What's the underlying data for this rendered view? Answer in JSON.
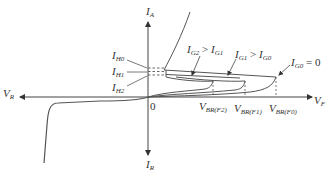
{
  "diagram": {
    "title": "",
    "type": "thyristor-iv-characteristic",
    "axes": {
      "vertical_up": {
        "symbol": "I",
        "sub": "A"
      },
      "vertical_down": {
        "symbol": "I",
        "sub": "R"
      },
      "horizontal_right": {
        "symbol": "V",
        "sub": "F"
      },
      "horizontal_left": {
        "symbol": "V",
        "sub": "R"
      },
      "origin": "0"
    },
    "holding_currents": [
      {
        "symbol": "I",
        "sub": "H0"
      },
      {
        "symbol": "I",
        "sub": "H1"
      },
      {
        "symbol": "I",
        "sub": "H2"
      }
    ],
    "breakover_voltages": [
      {
        "symbol": "V",
        "sub": "BR(F2)"
      },
      {
        "symbol": "V",
        "sub": "BR(F1)"
      },
      {
        "symbol": "V",
        "sub": "BR(F0)"
      }
    ],
    "gate_annotations": [
      {
        "a": "I",
        "a_sub": "G2",
        "op": " > ",
        "b": "I",
        "b_sub": "G1"
      },
      {
        "a": "I",
        "a_sub": "G1",
        "op": " > ",
        "b": "I",
        "b_sub": "G0"
      },
      {
        "a": "I",
        "a_sub": "G0",
        "op": " = ",
        "b": "0",
        "b_sub": ""
      }
    ],
    "colors": {
      "line": "#555555",
      "text": "#333333",
      "background": "#ffffff"
    }
  }
}
